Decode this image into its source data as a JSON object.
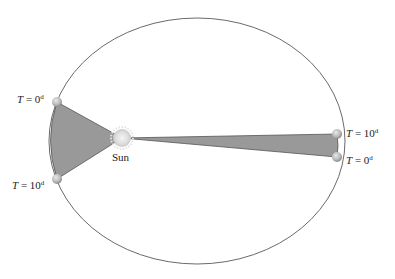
{
  "diagram": {
    "orbit": {
      "cx": 197,
      "cy": 141,
      "rx": 148,
      "ry": 123,
      "stroke": "#666666"
    },
    "sun": {
      "x": 122,
      "y": 138,
      "label": "Sun",
      "color": "#e6e6e6"
    },
    "sector_fill": "#999999",
    "planet_color": "#bdbdbd",
    "labels": {
      "left_top": {
        "var": "T",
        "eq": " = 0",
        "unit": "d"
      },
      "left_bottom": {
        "var": "T",
        "eq": " = 10",
        "unit": "d"
      },
      "right_top": {
        "var": "T",
        "eq": " = 10",
        "unit": "d"
      },
      "right_bottom": {
        "var": "T",
        "eq": " = 0",
        "unit": "d"
      }
    }
  }
}
